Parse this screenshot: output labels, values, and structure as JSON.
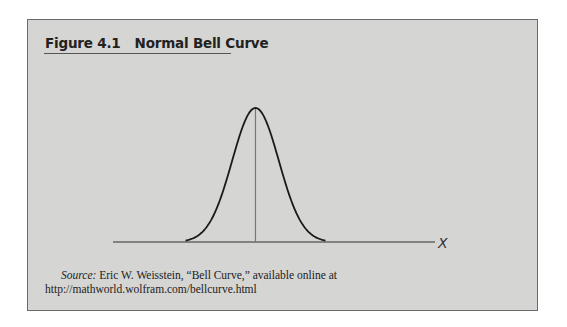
{
  "figure": {
    "number": "Figure 4.1",
    "title": "Normal Bell Curve"
  },
  "chart_data": {
    "type": "line",
    "title": "Normal Bell Curve",
    "xlabel": "X",
    "ylabel": "",
    "series": [
      {
        "name": "Normal distribution",
        "description": "Symmetric bell-shaped curve with vertical line at the mean",
        "x": [
          -3,
          -2.5,
          -2,
          -1.5,
          -1,
          -0.5,
          0,
          0.5,
          1,
          1.5,
          2,
          2.5,
          3
        ],
        "values": [
          0.004,
          0.018,
          0.054,
          0.13,
          0.242,
          0.352,
          0.399,
          0.352,
          0.242,
          0.13,
          0.054,
          0.018,
          0.004
        ]
      }
    ],
    "annotations": [
      "vertical line at mean (x = 0)"
    ],
    "grid": false,
    "legend": "none",
    "ticks": "none"
  },
  "axis": {
    "x_label": "X"
  },
  "source": {
    "label": "Source:",
    "text": " Eric W. Weisstein, “Bell Curve,” available online at http://mathworld.wolfram.com/bellcurve.html"
  }
}
